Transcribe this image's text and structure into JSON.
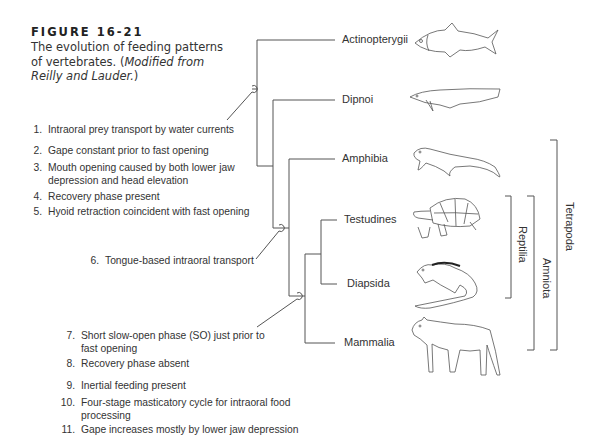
{
  "caption": {
    "figure_number": "FIGURE 16-21",
    "text": "The evolution of feeding patterns of vertebrates. (",
    "italic": "Modified from Reilly and Lauder.",
    "close": ")"
  },
  "taxa": [
    {
      "label": "Actinopterygii",
      "animal": "ray-finned fish"
    },
    {
      "label": "Dipnoi",
      "animal": "lungfish"
    },
    {
      "label": "Amphibia",
      "animal": "salamander"
    },
    {
      "label": "Testudines",
      "animal": "tortoise"
    },
    {
      "label": "Diapsida",
      "animal": "iguana"
    },
    {
      "label": "Mammalia",
      "animal": "opossum"
    }
  ],
  "clades": [
    {
      "label": "Reptilia"
    },
    {
      "label": "Amniota"
    },
    {
      "label": "Tetrapoda"
    }
  ],
  "characters": {
    "group1": [
      {
        "num": "1.",
        "text": "Intraoral prey transport by water currents"
      },
      {
        "num": "2.",
        "text": "Gape constant prior to fast opening"
      },
      {
        "num": "3.",
        "text": "Mouth opening caused by both lower jaw",
        "text2": "depression and head elevation"
      },
      {
        "num": "4.",
        "text": "Recovery phase present"
      },
      {
        "num": "5.",
        "text": "Hyoid retraction coincident with fast opening"
      }
    ],
    "group2": [
      {
        "num": "6.",
        "text": "Tongue-based intraoral transport"
      }
    ],
    "group3": [
      {
        "num": "7.",
        "text": "Short slow-open phase (SO) just prior to",
        "text2": "fast opening"
      },
      {
        "num": "8.",
        "text": "Recovery phase absent"
      },
      {
        "num": "9.",
        "text": "Inertial feeding present"
      },
      {
        "num": "10.",
        "text": "Four-stage masticatory cycle for intraoral food",
        "text2": "processing"
      },
      {
        "num": "11.",
        "text": "Gape increases mostly by lower jaw depression"
      }
    ]
  }
}
